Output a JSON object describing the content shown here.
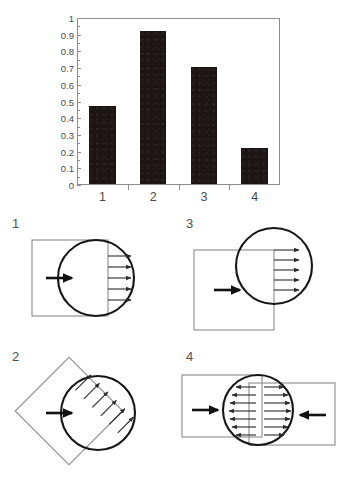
{
  "figure": {
    "background_color": "#ffffff",
    "ink_color": "#2b2b2b",
    "bar_color": "#1b1613",
    "frame_color": "#8d8d8d"
  },
  "chart_data": {
    "type": "bar",
    "title": "",
    "xlabel": "",
    "ylabel": "Selection unit response",
    "categories": [
      "1",
      "2",
      "3",
      "4"
    ],
    "values": [
      0.47,
      0.93,
      0.71,
      0.22
    ],
    "ylim": [
      0,
      1
    ],
    "ytick_labels": [
      "0",
      "0.1",
      "0.2",
      "0.3",
      "0.4",
      "0.5",
      "0.6",
      "0.7",
      "0.8",
      "0.9",
      "1"
    ],
    "ytick_values": [
      0,
      0.1,
      0.2,
      0.3,
      0.4,
      0.5,
      0.6,
      0.7,
      0.8,
      0.9,
      1
    ],
    "xtick_labels": [
      "1",
      "2",
      "3",
      "4"
    ],
    "grid": false,
    "legend": "none",
    "series": [
      {
        "name": "Selection unit response",
        "values": [
          0.47,
          0.93,
          0.71,
          0.22
        ]
      }
    ]
  },
  "diagrams": {
    "panels": [
      {
        "label": "1",
        "name": "square-circle-right-overlap",
        "shape": "square",
        "stimulus_arrows": 1,
        "response_arrows": 5,
        "response_direction": "right"
      },
      {
        "label": "2",
        "name": "diamond-circle-overlap",
        "shape": "diamond",
        "stimulus_arrows": 1,
        "response_arrows": 6,
        "response_direction": "perpendicular-diagonal"
      },
      {
        "label": "3",
        "name": "square-circle-offset-upright",
        "shape": "square",
        "stimulus_arrows": 1,
        "response_arrows": 5,
        "response_direction": "right"
      },
      {
        "label": "4",
        "name": "two-rectangles-circle-center",
        "shape": "double-rectangle",
        "stimulus_arrows": 2,
        "response_arrows": 14,
        "response_direction": "bidirectional"
      }
    ]
  }
}
